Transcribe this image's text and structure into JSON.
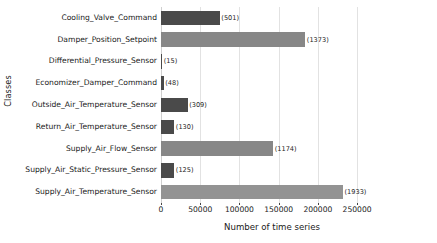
{
  "chart_data": {
    "type": "bar",
    "orientation": "horizontal",
    "title": "",
    "xlabel": "Number of time series",
    "ylabel": "Classes",
    "xlim": [
      0,
      283000
    ],
    "xticks": [
      0,
      50000,
      100000,
      150000,
      200000,
      250000
    ],
    "xtick_labels": [
      "0",
      "50000",
      "100000",
      "150000",
      "200000",
      "250000"
    ],
    "grid": "vertical",
    "legend": "none",
    "annotation_note": "Parenthesised number after each bar is the class count (number of distinct series / instances).",
    "categories": [
      "Cooling_Valve_Command",
      "Damper_Position_Setpoint",
      "Differential_Pressure_Sensor",
      "Economizer_Damper_Command",
      "Outside_Air_Temperature_Sensor",
      "Return_Air_Temperature_Sensor",
      "Supply_Air_Flow_Sensor",
      "Supply_Air_Static_Pressure_Sensor",
      "Supply_Air_Temperature_Sensor"
    ],
    "values": [
      75000,
      184000,
      1500,
      3500,
      34000,
      17000,
      143000,
      17000,
      232000
    ],
    "labels": [
      "(501)",
      "(1373)",
      "(15)",
      "(48)",
      "(309)",
      "(130)",
      "(1174)",
      "(125)",
      "(1933)"
    ],
    "counts": [
      501,
      1373,
      15,
      48,
      309,
      130,
      1174,
      125,
      1933
    ],
    "bar_colors": [
      "#4a4a4a",
      "#878787",
      "#4a4a4a",
      "#4a4a4a",
      "#4a4a4a",
      "#4a4a4a",
      "#878787",
      "#4a4a4a",
      "#939393"
    ],
    "colors": {
      "dark_bar": "#4a4a4a",
      "light_bar": "#878787",
      "grid": "#e2e2e2",
      "text": "#1a1a1a",
      "background": "#ffffff"
    }
  }
}
